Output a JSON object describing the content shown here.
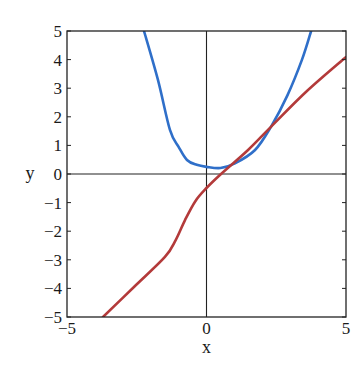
{
  "chart_data": {
    "type": "line",
    "title": "",
    "xlabel": "x",
    "ylabel": "y",
    "xlim": [
      -5,
      5
    ],
    "ylim": [
      -5,
      5
    ],
    "grid": false,
    "legend": null,
    "x_ticks": [
      -5,
      0,
      5
    ],
    "x_tick_labels": [
      "−5",
      "0",
      "5"
    ],
    "y_ticks": [
      -5,
      -4,
      -3,
      -2,
      -1,
      0,
      1,
      2,
      3,
      4,
      5
    ],
    "y_tick_labels": [
      "−5",
      "−4",
      "−3",
      "−2",
      "−1",
      "0",
      "1",
      "2",
      "3",
      "4",
      "5"
    ],
    "zero_lines": {
      "x": 0,
      "y": 0
    },
    "series": [
      {
        "name": "blue-curve",
        "color": "#2f6fc9",
        "points": [
          [
            -2.24,
            5.0
          ],
          [
            -1.74,
            3.29
          ],
          [
            -1.31,
            1.54
          ],
          [
            -1.0,
            0.95
          ],
          [
            -0.7,
            0.49
          ],
          [
            -0.35,
            0.32
          ],
          [
            0.0,
            0.25
          ],
          [
            0.5,
            0.21
          ],
          [
            1.0,
            0.36
          ],
          [
            1.74,
            0.84
          ],
          [
            2.31,
            1.65
          ],
          [
            2.9,
            2.75
          ],
          [
            3.42,
            3.99
          ],
          [
            3.75,
            5.0
          ]
        ]
      },
      {
        "name": "red-curve",
        "color": "#b33a3a",
        "points": [
          [
            -3.71,
            -5.0
          ],
          [
            -2.6,
            -3.95
          ],
          [
            -1.49,
            -2.9
          ],
          [
            -1.1,
            -2.3
          ],
          [
            -0.77,
            -1.61
          ],
          [
            -0.4,
            -0.95
          ],
          [
            0.0,
            -0.49
          ],
          [
            0.52,
            0.0
          ],
          [
            1.49,
            0.84
          ],
          [
            2.31,
            1.65
          ],
          [
            3.6,
            2.9
          ],
          [
            5.0,
            4.09
          ]
        ]
      }
    ]
  }
}
